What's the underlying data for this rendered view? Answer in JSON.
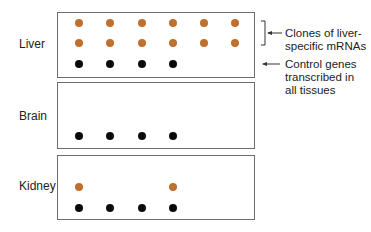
{
  "colors": {
    "liver_specific": "#c0702e",
    "control": "#0a0a0a",
    "border": "#6e6e6e"
  },
  "tissues": [
    {
      "label": "Liver"
    },
    {
      "label": "Brain"
    },
    {
      "label": "Kidney"
    }
  ],
  "annotations": {
    "liver_specific": {
      "line1": "Clones of liver-",
      "line2": "specific mRNAs"
    },
    "control": {
      "line1": "Control genes",
      "line2": "transcribed in",
      "line3": "all tissues"
    }
  },
  "grid": {
    "columns_x": [
      79,
      110,
      142,
      173,
      204,
      235
    ],
    "liver": {
      "row1": [
        "orange",
        "orange",
        "orange",
        "orange",
        "orange",
        "orange"
      ],
      "row2": [
        "orange",
        "orange",
        "orange",
        "orange",
        "orange",
        "orange"
      ],
      "row3": [
        "black",
        "black",
        "black",
        "black",
        null,
        null
      ]
    },
    "brain": {
      "row3": [
        "black",
        "black",
        "black",
        "black",
        null,
        null
      ]
    },
    "kidney": {
      "row2": [
        "orange",
        null,
        null,
        "orange",
        null,
        null
      ],
      "row3": [
        "black",
        "black",
        "black",
        "black",
        null,
        null
      ]
    }
  }
}
